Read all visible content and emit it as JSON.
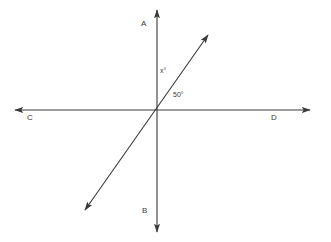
{
  "figure": {
    "type": "geometry-diagram",
    "background_color": "#ffffff",
    "stroke_color": "#3a3a3a",
    "label_color": "#3a3a3a",
    "width": 331,
    "height": 242,
    "intersection": {
      "x": 157,
      "y": 110
    },
    "lines": [
      {
        "name": "line-AB",
        "from_label": "A",
        "to_label": "B",
        "x1": 157,
        "y1": 10,
        "x2": 157,
        "y2": 232,
        "arrow_start": true,
        "arrow_end": true
      },
      {
        "name": "line-CD",
        "from_label": "C",
        "to_label": "D",
        "x1": 15,
        "y1": 110,
        "x2": 310,
        "y2": 110,
        "arrow_start": true,
        "arrow_end": true
      },
      {
        "name": "diagonal-ray",
        "from_label": "",
        "to_label": "",
        "x1": 85,
        "y1": 210,
        "x2": 208,
        "y2": 35,
        "arrow_start": true,
        "arrow_end": true
      }
    ],
    "point_labels": [
      {
        "id": "A",
        "text": "A",
        "x": 145,
        "y": 24
      },
      {
        "id": "B",
        "text": "B",
        "x": 146,
        "y": 211
      },
      {
        "id": "C",
        "text": "C",
        "x": 31,
        "y": 118
      },
      {
        "id": "D",
        "text": "D",
        "x": 275,
        "y": 118
      }
    ],
    "angle_labels": [
      {
        "id": "x",
        "text": "x°",
        "x": 163,
        "y": 71,
        "between": [
          "ray-OA",
          "diagonal-ray-upper"
        ]
      },
      {
        "id": "fifty",
        "text": "50°",
        "x": 180,
        "y": 95,
        "between": [
          "diagonal-ray-upper",
          "ray-OD"
        ]
      }
    ]
  }
}
